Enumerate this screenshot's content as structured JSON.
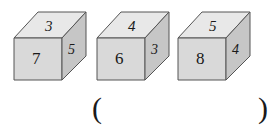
{
  "figure": {
    "type": "three-isometric-cubes",
    "cubes": [
      {
        "id": "cube-1",
        "top": "3",
        "front": "7",
        "side": "5",
        "x": 14,
        "y": 10
      },
      {
        "id": "cube-2",
        "top": "4",
        "front": "6",
        "side": "3",
        "x": 97,
        "y": 10
      },
      {
        "id": "cube-3",
        "top": "5",
        "front": "8",
        "side": "4",
        "x": 178,
        "y": 10
      }
    ]
  },
  "answer": {
    "open_paren": "(",
    "close_paren": ")",
    "value": ""
  },
  "colors": {
    "top_face": "#e8e8e8",
    "front_face": "#d9d9d9",
    "side_face": "#c6c6c6",
    "edge": "#555555",
    "digit": "#1a1a1a",
    "background": "#ffffff"
  }
}
